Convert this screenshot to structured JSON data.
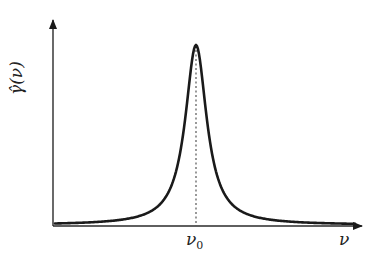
{
  "chart_data": {
    "type": "line",
    "title": "",
    "xlabel": "ν",
    "ylabel": "γ̂(ν)",
    "x_tick_labels": [
      "ν₀"
    ],
    "annotations": [
      "dotted vertical line at ν₀ marking the peak"
    ],
    "curve": "Lorentzian-shaped peak centered at ν₀",
    "series": [
      {
        "name": "γ̂(ν)",
        "x": [
          -1.0,
          -0.8,
          -0.6,
          -0.4,
          -0.3,
          -0.2,
          -0.15,
          -0.1,
          -0.05,
          0.0,
          0.05,
          0.1,
          0.15,
          0.2,
          0.3,
          0.4,
          0.6,
          0.8,
          1.0
        ],
        "values": [
          0.01,
          0.015,
          0.025,
          0.05,
          0.08,
          0.16,
          0.25,
          0.42,
          0.74,
          1.0,
          0.74,
          0.42,
          0.25,
          0.16,
          0.08,
          0.05,
          0.025,
          0.015,
          0.01
        ]
      }
    ],
    "x_center_label": "ν₀",
    "grid": false,
    "legend": null
  },
  "labels": {
    "y_axis_main": "γ̂(",
    "y_axis_var": "ν",
    "y_axis_close": ")",
    "y_axis_full": "γ̂(ν)",
    "x_axis": "ν",
    "x_center_main": "ν",
    "x_center_sub": "0"
  },
  "colors": {
    "curve": "#1a1a1a",
    "axes": "#2a2a2a",
    "dotted": "#555555"
  }
}
